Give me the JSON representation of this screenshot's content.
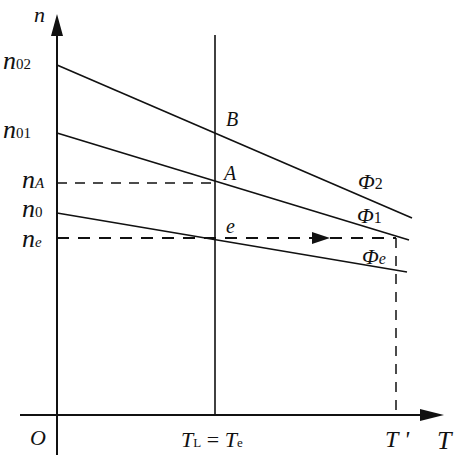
{
  "axes": {
    "y_label": "n",
    "x_label": "T",
    "origin_label": "O"
  },
  "y_ticks": [
    {
      "base": "n",
      "sub": "02",
      "y": 65
    },
    {
      "base": "n",
      "sub": "01",
      "y": 133
    },
    {
      "base": "n",
      "sub": "A",
      "y": 183
    },
    {
      "base": "n",
      "sub": "0",
      "y": 213
    },
    {
      "base": "n",
      "sub": "e",
      "y": 238
    }
  ],
  "x_ticks": [
    {
      "label_main": "T",
      "label_sub": "L",
      "eq": " = ",
      "label_main2": "T",
      "label_sub2": "e",
      "x": 215
    },
    {
      "label": "T '",
      "x": 396
    }
  ],
  "points": {
    "B": "B",
    "A": "A",
    "e": "e"
  },
  "curves": [
    {
      "name": "Φ",
      "sub": "2",
      "from": [
        57,
        65
      ],
      "to": [
        412,
        218
      ]
    },
    {
      "name": "Φ",
      "sub": "1",
      "from": [
        57,
        133
      ],
      "to": [
        409,
        240
      ]
    },
    {
      "name": "Φ",
      "sub": "e",
      "from": [
        57,
        213
      ],
      "to": [
        407,
        272
      ]
    }
  ],
  "colors": {
    "line": "#111111",
    "background": "#ffffff"
  }
}
